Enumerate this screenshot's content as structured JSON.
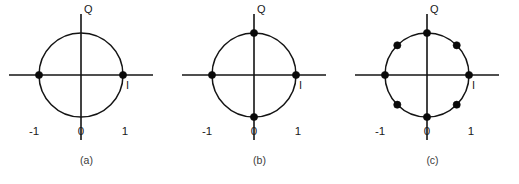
{
  "figure": {
    "background_color": "#ffffff",
    "line_color": "#141414",
    "dot_color": "#0a0a0a",
    "width": 519,
    "height": 184
  },
  "panels": [
    {
      "id": "panel-a",
      "caption": "(a)",
      "q_axis_label": "Q",
      "i_axis_label": "I",
      "tick_labels": {
        "negative_one": "-1",
        "zero": "0",
        "positive_one": "1"
      },
      "constellation": {
        "point_count": 2,
        "angles_deg": [
          0,
          180
        ]
      }
    },
    {
      "id": "panel-b",
      "caption": "(b)",
      "q_axis_label": "Q",
      "i_axis_label": "I",
      "tick_labels": {
        "negative_one": "-1",
        "zero": "0",
        "positive_one": "1"
      },
      "constellation": {
        "point_count": 4,
        "angles_deg": [
          0,
          90,
          180,
          270
        ]
      }
    },
    {
      "id": "panel-c",
      "caption": "(c)",
      "q_axis_label": "Q",
      "i_axis_label": "I",
      "tick_labels": {
        "negative_one": "-1",
        "zero": "0",
        "positive_one": "1"
      },
      "constellation": {
        "point_count": 8,
        "angles_deg": [
          0,
          45,
          90,
          135,
          180,
          225,
          270,
          315
        ]
      }
    }
  ],
  "geometry": {
    "center_x": 81,
    "center_y": 75,
    "radius": 42,
    "axis_half_length": 72,
    "dot_radius": 3.6
  }
}
